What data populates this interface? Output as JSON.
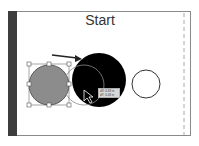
{
  "artboard": {
    "title": "Start",
    "border_color": "#8a8a8a",
    "leftbar_color": "#3d3d3d"
  },
  "objects": {
    "selected_circle": {
      "fill": "#8c8c8c",
      "stroke": "#5a5a5a"
    },
    "ghost_circle": {
      "stroke": "#7a7a7a"
    },
    "black_circle": {
      "fill": "#000000"
    },
    "small_circle": {
      "fill": "#ffffff",
      "stroke": "#333333"
    },
    "guide": {
      "color": "#b8b8b8"
    }
  },
  "tooltip": {
    "line1": "dX: 0.83 in",
    "line2": "dY: 0.03 in"
  },
  "icons": {
    "cursor": "selection-arrow-icon",
    "drag_arrow": "arrow-right-icon"
  }
}
